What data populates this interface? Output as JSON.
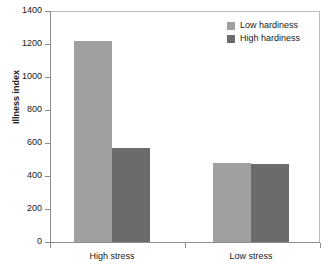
{
  "chart_data": {
    "type": "bar",
    "title": "",
    "xlabel": "",
    "ylabel": "Illness index",
    "categories": [
      "High stress",
      "Low stress"
    ],
    "series": [
      {
        "name": "Low hardiness",
        "color": "#a0a0a0",
        "values": [
          1220,
          480
        ]
      },
      {
        "name": "High hardiness",
        "color": "#6b6b6b",
        "values": [
          570,
          472
        ]
      }
    ],
    "ylim": [
      0,
      1400
    ],
    "ytick_step": 200,
    "yticks": [
      0,
      200,
      400,
      600,
      800,
      1000,
      1200,
      1400
    ],
    "ytick_labels": [
      "0",
      "200",
      "400",
      "600",
      "800",
      "1000",
      "1200",
      "1400"
    ],
    "grid": false,
    "legend_position": "top-right",
    "bar_gap_between_groups": true
  },
  "legend": {
    "items": [
      {
        "label": "Low hardiness",
        "swatch": "#a0a0a0"
      },
      {
        "label": "High hardiness",
        "swatch": "#6b6b6b"
      }
    ]
  },
  "axes": {
    "y_title": "Illness index"
  }
}
